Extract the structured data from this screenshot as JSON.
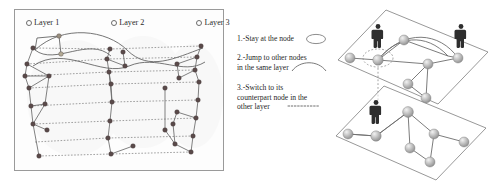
{
  "figure": {
    "left_panel": {
      "layer_legend": [
        {
          "marker": "circle-outline",
          "label": "Layer 1"
        },
        {
          "marker": "circle-outline",
          "label": "Layer 2"
        },
        {
          "marker": "circle-outline",
          "label": "Layer 3"
        }
      ],
      "description": "Flattened multilayer network: three node columns (layers) with solid intra-layer edges and horizontal dotted inter-layer replica links",
      "node_color": "#5a4a4a",
      "edge_color": "#6a6a6a",
      "interlayer_link_style": "dotted",
      "border_color": "#9a9a9a"
    },
    "rules": [
      {
        "number": "1.-",
        "lines": [
          "1.-Stay at the node"
        ],
        "glyph": "self-loop-ellipse"
      },
      {
        "number": "2.-",
        "lines": [
          "2.-Jump to other nodes",
          "in the same layer"
        ],
        "glyph": "arc-curve"
      },
      {
        "number": "3.-",
        "lines": [
          "3.-Switch to its",
          "counterpart node in the",
          "other layer"
        ],
        "glyph": "dotted-line"
      }
    ],
    "layers_diagram": {
      "description": "Two stacked 3D parallelogram planes representing two network layers, each with sphere nodes joined by edges; human figures mark walker positions",
      "planes": [
        {
          "name": "upper-layer-plane",
          "figures": 2
        },
        {
          "name": "lower-layer-plane",
          "figures": 1
        }
      ],
      "node_fill": "#b9b9b9",
      "plane_stroke": "#7d7d7d",
      "figure_color": "#2e2e2e",
      "highlight_style": "dotted-ellipse",
      "vertical_link_style": "dotted"
    }
  }
}
